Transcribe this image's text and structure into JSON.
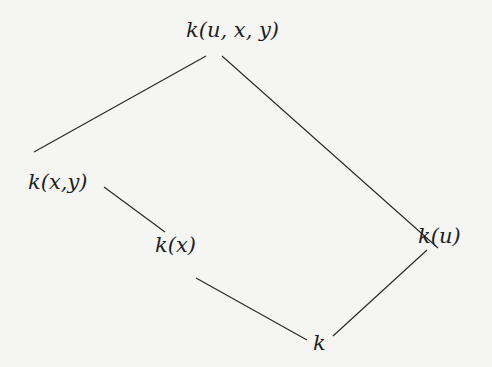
{
  "diagram": {
    "type": "lattice",
    "nodes": [
      {
        "id": "kuxy",
        "label": "k(u, x, y)"
      },
      {
        "id": "kxy",
        "label": "k(x,y)"
      },
      {
        "id": "kx",
        "label": "k(x)"
      },
      {
        "id": "ku",
        "label": "k(u)"
      },
      {
        "id": "k",
        "label": "k"
      }
    ],
    "edges": [
      [
        "kuxy",
        "kxy"
      ],
      [
        "kuxy",
        "ku"
      ],
      [
        "kxy",
        "kx"
      ],
      [
        "kx",
        "k"
      ],
      [
        "ku",
        "k"
      ]
    ],
    "colors": {
      "line": "#2a2a2a",
      "text": "#1e1e1e",
      "background": "#f5f5f3"
    }
  }
}
